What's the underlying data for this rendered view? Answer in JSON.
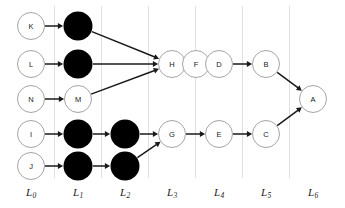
{
  "diagram": {
    "colors": {
      "node_fill_open": "#ffffff",
      "node_fill_solid": "#000000",
      "node_stroke": "#9a9a9a",
      "edge": "#1a1a1a",
      "gridline": "#d8d8d8",
      "label": "#1c1c1c",
      "background": "#ffffff"
    },
    "geometry": {
      "node_radius": 13.5,
      "solid_radius": 14.5,
      "stroke_width": 0.9,
      "edge_width": 1.5
    },
    "layers": [
      {
        "id": "L0",
        "label": "L",
        "sub": "0",
        "x": 31,
        "divider_x": 54.5,
        "label_y": 186
      },
      {
        "id": "L1",
        "label": "L",
        "sub": "1",
        "x": 78,
        "divider_x": 101.5,
        "label_y": 186
      },
      {
        "id": "L2",
        "label": "L",
        "sub": "2",
        "x": 125,
        "divider_x": 148.5,
        "label_y": 186
      },
      {
        "id": "L3",
        "label": "L",
        "sub": "3",
        "x": 172,
        "divider_x": 195.5,
        "label_y": 186
      },
      {
        "id": "L4",
        "label": "L",
        "sub": "4",
        "x": 219,
        "divider_x": 242.5,
        "label_y": 186
      },
      {
        "id": "L5",
        "label": "L",
        "sub": "5",
        "x": 266,
        "divider_x": 289.5,
        "label_y": 186
      },
      {
        "id": "L6",
        "label": "L",
        "sub": "6",
        "x": 313,
        "divider_x": null,
        "label_y": 186
      }
    ],
    "gridlines": {
      "y_top": 6,
      "y_bottom": 178,
      "x_positions": [
        54.5,
        101.5,
        148.5,
        195.5,
        242.5,
        289.5
      ]
    },
    "nodes": [
      {
        "id": "n_K",
        "label": "K",
        "layer": "L0",
        "x": 31,
        "y": 26,
        "filled": false
      },
      {
        "id": "n_L",
        "label": "L",
        "layer": "L0",
        "x": 31,
        "y": 64,
        "filled": false
      },
      {
        "id": "n_N",
        "label": "N",
        "layer": "L0",
        "x": 31,
        "y": 99,
        "filled": false
      },
      {
        "id": "n_I",
        "label": "I",
        "layer": "L0",
        "x": 31,
        "y": 134,
        "filled": false
      },
      {
        "id": "n_J",
        "label": "J",
        "layer": "L0",
        "x": 31,
        "y": 166,
        "filled": false
      },
      {
        "id": "n_b1",
        "label": "",
        "layer": "L1",
        "x": 78,
        "y": 26,
        "filled": true
      },
      {
        "id": "n_b2",
        "label": "",
        "layer": "L1",
        "x": 78,
        "y": 64,
        "filled": true
      },
      {
        "id": "n_M",
        "label": "M",
        "layer": "L1",
        "x": 78,
        "y": 99,
        "filled": false
      },
      {
        "id": "n_b3",
        "label": "",
        "layer": "L1",
        "x": 78,
        "y": 134,
        "filled": true
      },
      {
        "id": "n_b4",
        "label": "",
        "layer": "L1",
        "x": 78,
        "y": 166,
        "filled": true
      },
      {
        "id": "n_b5",
        "label": "",
        "layer": "L2",
        "x": 125,
        "y": 134,
        "filled": true
      },
      {
        "id": "n_b6",
        "label": "",
        "layer": "L2",
        "x": 125,
        "y": 166,
        "filled": true
      },
      {
        "id": "n_H",
        "label": "H",
        "layer": "L3",
        "x": 172,
        "y": 64,
        "filled": false
      },
      {
        "id": "n_G",
        "label": "G",
        "layer": "L3",
        "x": 172,
        "y": 134,
        "filled": false
      },
      {
        "id": "n_F",
        "label": "F",
        "layer": "L4",
        "x": 219,
        "y": 64,
        "filled": false
      },
      {
        "id": "n_E",
        "label": "E",
        "layer": "L4",
        "x": 219,
        "y": 134,
        "filled": false
      },
      {
        "id": "n_D",
        "label": "D",
        "layer": "L5",
        "x": 266,
        "y": 64,
        "filled": false
      },
      {
        "id": "n_C",
        "label": "C",
        "layer": "L5",
        "x": 266,
        "y": 134,
        "filled": false
      },
      {
        "id": "n_B",
        "label": "B",
        "layer": "L6",
        "x": 266,
        "y": 64,
        "filled": false
      },
      {
        "id": "n_A",
        "label": "A",
        "layer": "L6",
        "x": 313,
        "y": 99,
        "filled": false
      }
    ],
    "node_overrides": {
      "n_B": {
        "x": 266,
        "y": 64
      },
      "n_D": {
        "x": 219,
        "y": 64
      },
      "n_F": {
        "x": 196,
        "y": 64
      }
    },
    "edges": [
      {
        "id": "e_K_b1",
        "from": "n_K",
        "to": "n_b1",
        "arrow": true
      },
      {
        "id": "e_L_b2",
        "from": "n_L",
        "to": "n_b2",
        "arrow": true
      },
      {
        "id": "e_N_M",
        "from": "n_N",
        "to": "n_M",
        "arrow": true
      },
      {
        "id": "e_I_b3",
        "from": "n_I",
        "to": "n_b3",
        "arrow": true
      },
      {
        "id": "e_J_b4",
        "from": "n_J",
        "to": "n_b4",
        "arrow": true
      },
      {
        "id": "e_b1_H",
        "from": "n_b1",
        "to": "n_H",
        "arrow": true
      },
      {
        "id": "e_b2_H",
        "from": "n_b2",
        "to": "n_H",
        "arrow": true
      },
      {
        "id": "e_M_H",
        "from": "n_M",
        "to": "n_H",
        "arrow": true
      },
      {
        "id": "e_b3_b5",
        "from": "n_b3",
        "to": "n_b5",
        "arrow": true
      },
      {
        "id": "e_b4_b6",
        "from": "n_b4",
        "to": "n_b6",
        "arrow": true
      },
      {
        "id": "e_b5_G",
        "from": "n_b5",
        "to": "n_G",
        "arrow": true
      },
      {
        "id": "e_b6_G",
        "from": "n_b6",
        "to": "n_G",
        "arrow": true
      },
      {
        "id": "e_H_F",
        "from": "n_H",
        "to": "n_F",
        "arrow": true
      },
      {
        "id": "e_F_D",
        "from": "n_F",
        "to": "n_D",
        "arrow": true
      },
      {
        "id": "e_D_B",
        "from": "n_D",
        "to": "n_B",
        "arrow": true
      },
      {
        "id": "e_B_A",
        "from": "n_B",
        "to": "n_A",
        "arrow": true
      },
      {
        "id": "e_G_E",
        "from": "n_G",
        "to": "n_E",
        "arrow": true
      },
      {
        "id": "e_E_C",
        "from": "n_E",
        "to": "n_C",
        "arrow": true
      },
      {
        "id": "e_C_A",
        "from": "n_C",
        "to": "n_A",
        "arrow": true
      }
    ]
  }
}
